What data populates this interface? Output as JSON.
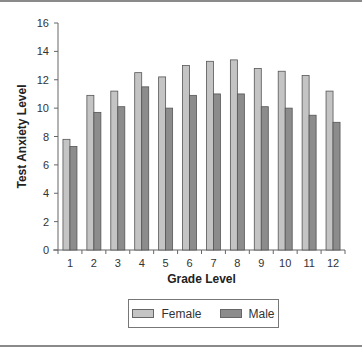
{
  "chart_data": {
    "type": "bar",
    "title": "",
    "xlabel": "Grade Level",
    "ylabel": "Test Anxiety Level",
    "categories": [
      "1",
      "2",
      "3",
      "4",
      "5",
      "6",
      "7",
      "8",
      "9",
      "10",
      "11",
      "12"
    ],
    "series": [
      {
        "name": "Female",
        "color": "#c4c4c4",
        "values": [
          7.8,
          10.9,
          11.2,
          12.5,
          12.2,
          13.0,
          13.3,
          13.4,
          12.8,
          12.6,
          12.3,
          11.2
        ]
      },
      {
        "name": "Male",
        "color": "#8c8c8c",
        "values": [
          7.3,
          9.7,
          10.1,
          11.5,
          10.0,
          10.9,
          11.0,
          11.0,
          10.1,
          10.0,
          9.5,
          9.0
        ]
      }
    ],
    "ylim": [
      0,
      16
    ],
    "yticks": [
      0,
      2,
      4,
      6,
      8,
      10,
      12,
      14,
      16
    ],
    "grid": false,
    "legend_position": "bottom"
  },
  "legend": {
    "female_label": "Female",
    "male_label": "Male"
  }
}
